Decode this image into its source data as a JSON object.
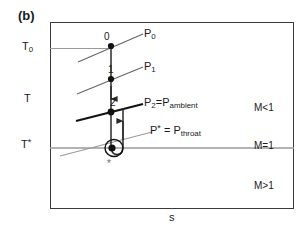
{
  "figure": {
    "panel_label": "(b)",
    "type": "T-s diagram (temperature-entropy) for nozzle flow"
  },
  "axes": {
    "y_title": "T",
    "x_title": "s",
    "y_ticks": [
      {
        "name": "stagnation-temperature",
        "label_main": "T",
        "label_sub": "0"
      },
      {
        "name": "throat-critical-temperature",
        "label_main": "T",
        "label_sup": "*"
      }
    ]
  },
  "mach_regions": [
    {
      "name": "subsonic",
      "label": "M<1"
    },
    {
      "name": "sonic",
      "label": "M=1"
    },
    {
      "name": "supersonic",
      "label": "M>1"
    }
  ],
  "isobars": [
    {
      "name": "stagnation-pressure",
      "label_main": "P",
      "label_sub": "0",
      "color": "#555555"
    },
    {
      "name": "pressure-1",
      "label_main": "P",
      "label_sub": "1",
      "color": "#555555"
    },
    {
      "name": "ambient-pressure",
      "label_main": "P",
      "label_sub": "2",
      "label_eq": "=P",
      "label_sub2": "ambient",
      "color": "#111111"
    },
    {
      "name": "throat-pressure",
      "label_main": "P",
      "label_sup": "*",
      "label_eq": " = P",
      "label_sub2": "throat",
      "color": "#8a8a8a"
    }
  ],
  "state_points": [
    {
      "name": "state-0",
      "label": "0"
    },
    {
      "name": "state-1",
      "label": "1"
    },
    {
      "name": "state-2",
      "label": "2"
    },
    {
      "name": "state-throat",
      "label": "*"
    }
  ],
  "colors": {
    "frame": "#3a3a3a",
    "constant_temp_line": "#9a9a9a",
    "process_path": "#2b2b2b",
    "point_fill": "#111111",
    "highlight_ring": "#111111"
  }
}
